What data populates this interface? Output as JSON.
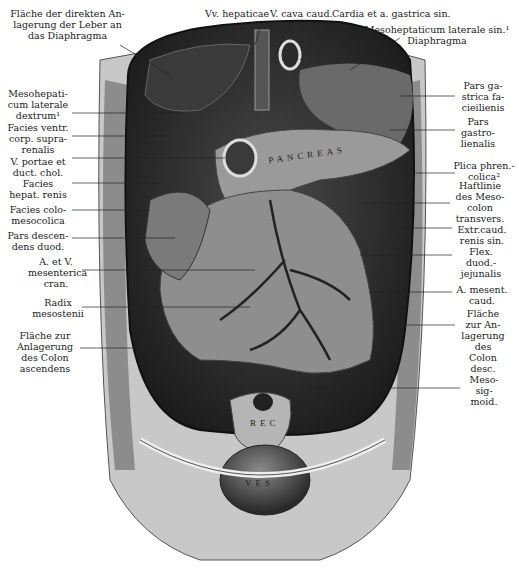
{
  "figure": {
    "top_labels": [
      {
        "text": "Fläche der direkten An-\nlagerung der Leber an\ndas Diaphragma",
        "x": 12,
        "y": 8
      },
      {
        "text": "Vv. hepaticae",
        "x": 205,
        "y": 10
      },
      {
        "text": "V. cava caud.",
        "x": 269,
        "y": 10
      },
      {
        "text": "Cardia et a. gastrica sin.",
        "x": 329,
        "y": 10
      },
      {
        "text": "Mesoheptaticum laterale sin.¹\nDiaphragma",
        "x": 360,
        "y": 25
      }
    ],
    "left_labels": [
      {
        "text": "Mesohepati-\ncum laterale\ndextrum¹",
        "x": 6,
        "y": 88
      },
      {
        "text": "Facies ventr.\ncorp. supra-\nrenalis",
        "x": 6,
        "y": 123
      },
      {
        "text": "V. portae et\nduct. chol.",
        "x": 6,
        "y": 157
      },
      {
        "text": "Facies\nhepat. renis",
        "x": 6,
        "y": 180
      },
      {
        "text": "Facies colo-\nmesocolica",
        "x": 6,
        "y": 206
      },
      {
        "text": "Pars descen-\ndens duod.",
        "x": 6,
        "y": 231
      },
      {
        "text": "A. et V.\nmesenterica\ncran.",
        "x": 28,
        "y": 255
      },
      {
        "text": "Radix\nmesostenii",
        "x": 30,
        "y": 297
      },
      {
        "text": "Fläche zur\nAnlagerung\ndes Colon\nascendens",
        "x": 12,
        "y": 330
      }
    ],
    "right_labels": [
      {
        "text": "Pars ga-\nstrica fa-\ncieilienis",
        "x": 455,
        "y": 80
      },
      {
        "text": "Pars\ngastro-\nlienalis",
        "x": 455,
        "y": 118
      },
      {
        "text": "Plica phren.-\ncolica²",
        "x": 452,
        "y": 160
      },
      {
        "text": "Haftlinie\ndes Meso-\ncolon\ntransvers.",
        "x": 452,
        "y": 181
      },
      {
        "text": "Extr.caud.\nrenis sin.",
        "x": 452,
        "y": 224
      },
      {
        "text": "Flex.\nduod.-\njejunalis",
        "x": 458,
        "y": 245
      },
      {
        "text": "A. mesent.\ncaud.",
        "x": 452,
        "y": 285
      },
      {
        "text": "Fläche\nzur An-\nlagerung\ndes\nColon\ndesc.",
        "x": 460,
        "y": 309
      },
      {
        "text": "Meso-\nsig-\nmoid.",
        "x": 466,
        "y": 375
      }
    ],
    "in_image_labels": [
      {
        "text": "PANCREAS",
        "x": 268,
        "y": 158
      },
      {
        "text": "REC",
        "x": 259,
        "y": 424
      },
      {
        "text": "VES",
        "x": 249,
        "y": 482
      }
    ],
    "colors": {
      "cavity_dark": "#2a2a2a",
      "organ_light": "#9a9a9a",
      "body_wall": "#c8c8c8",
      "ink": "#222222"
    }
  }
}
